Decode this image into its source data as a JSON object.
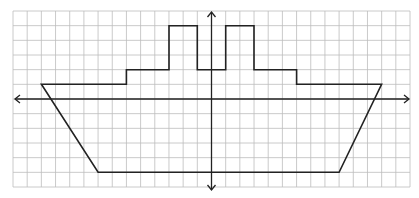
{
  "diagram": {
    "type": "coordinate-grid-figure",
    "grid": {
      "columns": 28,
      "rows": 12,
      "x_min": -14,
      "x_max": 14,
      "y_min": -6,
      "y_max": 6,
      "line_color": "#bdbdbd"
    },
    "axes": {
      "color": "#222222",
      "x_arrows": true,
      "y_arrows": true
    },
    "shape": {
      "name": "ship",
      "stroke": "#222222",
      "vertices": [
        [
          -12,
          1
        ],
        [
          -6,
          1
        ],
        [
          -6,
          2
        ],
        [
          -3,
          2
        ],
        [
          -3,
          5
        ],
        [
          -1,
          5
        ],
        [
          -1,
          2
        ],
        [
          1,
          2
        ],
        [
          1,
          5
        ],
        [
          3,
          5
        ],
        [
          3,
          2
        ],
        [
          6,
          2
        ],
        [
          6,
          1
        ],
        [
          12,
          1
        ],
        [
          9,
          -5
        ],
        [
          -8,
          -5
        ]
      ]
    }
  }
}
